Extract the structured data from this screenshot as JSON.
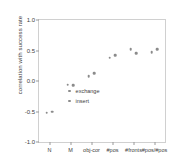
{
  "chart_data": {
    "type": "scatter",
    "title": "",
    "xlabel": "",
    "ylabel": "correlation with success rate",
    "ylim": [
      -1.0,
      1.0
    ],
    "grid": false,
    "legend_position": "bottom-right",
    "categories": [
      "N",
      "M",
      "obj-cor",
      "#pos",
      "#fronts",
      "#pos/#pos"
    ],
    "yticks": [
      "1.0",
      "0.5",
      "0.0",
      "-0.5",
      "-1.0"
    ],
    "ytick_values": [
      1.0,
      0.5,
      0.0,
      -0.5,
      -1.0
    ],
    "series": [
      {
        "name": "exchange",
        "color": "#8b8b8b",
        "values": [
          -0.52,
          -0.06,
          0.08,
          0.38,
          0.52,
          0.47
        ]
      },
      {
        "name": "insert",
        "color": "#8b8b8b",
        "values": [
          -0.5,
          -0.07,
          0.13,
          0.42,
          0.46,
          0.52
        ]
      }
    ]
  },
  "legend": {
    "items": [
      {
        "label": "exchange"
      },
      {
        "label": "insert"
      }
    ]
  }
}
